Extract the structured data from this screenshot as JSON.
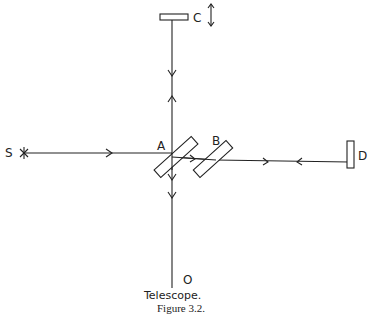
{
  "diagram": {
    "labels": {
      "source": "S",
      "splitter_a": "A",
      "plate_b": "B",
      "mirror_c": "C",
      "mirror_d": "D",
      "telescope_point": "O"
    },
    "telescope_label": "Telescope.",
    "caption": "Figure 3.2.",
    "colors": {
      "ink": "#222222",
      "background": "#ffffff"
    }
  }
}
